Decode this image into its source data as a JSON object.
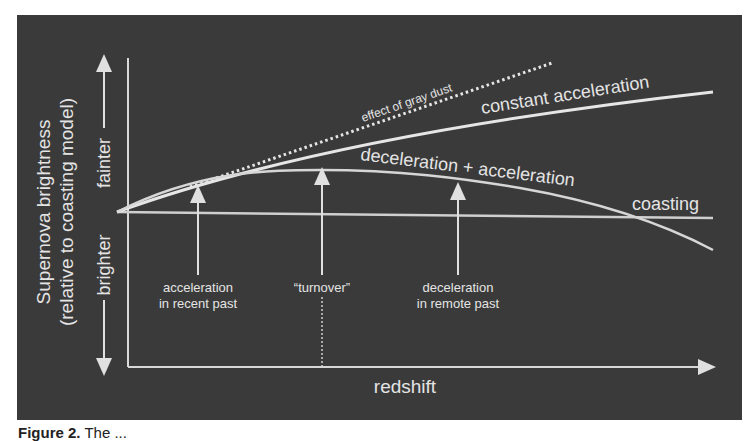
{
  "figure": {
    "y_axis": {
      "title_line1": "Supernova brightness",
      "title_line2": "(relative to coasting model)",
      "up_label": "fainter",
      "down_label": "brighter"
    },
    "x_axis": {
      "title": "redshift"
    },
    "curves": {
      "gray_dust": "effect of gray dust",
      "constant_acceleration": "constant acceleration",
      "decel_accel": "deceleration + acceleration",
      "coasting": "coasting"
    },
    "annotations": {
      "recent_line1": "acceleration",
      "recent_line2": "in recent past",
      "turnover": "“turnover”",
      "remote_line1": "deceleration",
      "remote_line2": "in remote past"
    },
    "colors": {
      "panel": "#3a3a3a",
      "line": "#dcdcdc",
      "text": "#e4e4e4"
    }
  },
  "caption": {
    "label": "Figure 2.",
    "text": "The ..."
  }
}
